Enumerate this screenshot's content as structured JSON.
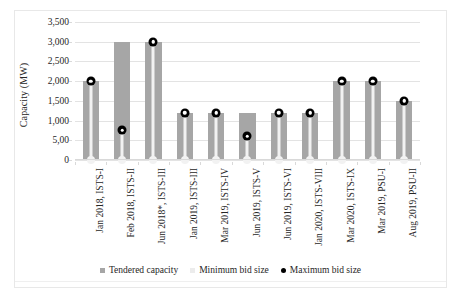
{
  "chart_data": {
    "type": "bar",
    "title": "",
    "xlabel": "",
    "ylabel": "Capacity (MW)",
    "ylim": [
      0,
      3500
    ],
    "ytick_labels": [
      "3,500",
      "3,000",
      "2,500",
      "2,000",
      "1,500",
      "1,000",
      "5,00",
      "0"
    ],
    "ytick_values": [
      3500,
      3000,
      2500,
      2000,
      1500,
      1000,
      500,
      0
    ],
    "grid": true,
    "legend_position": "bottom",
    "categories": [
      "Jan 2018, ISTS-I",
      "Feb 2018, ISTS-II",
      "Jun 2018*, ISTS-III",
      "Jan 2019, ISTS-III",
      "Mar 2019, ISTS-IV",
      "Jun 2019, ISTS-V",
      "Jun 2019, ISTS-VI",
      "Jan 2020, ISTS-VIII",
      "Mar 2020, ISTS-IX",
      "Mar 2019, PSU-I",
      "Aug 2019, PSU-II"
    ],
    "series": [
      {
        "name": "Tendered capacity",
        "type": "bar",
        "color": "#a6a6a6",
        "values": [
          2000,
          3000,
          3000,
          1200,
          1200,
          1200,
          1200,
          1200,
          2000,
          2000,
          1500
        ]
      },
      {
        "name": "Minimum bid size",
        "type": "marker",
        "color": "#f2f2f2",
        "values": [
          0,
          0,
          0,
          0,
          0,
          0,
          0,
          0,
          0,
          0,
          0
        ]
      },
      {
        "name": "Maximum bid size",
        "type": "marker",
        "color": "#000000",
        "values": [
          2000,
          750,
          3000,
          1200,
          1200,
          600,
          1200,
          1200,
          2000,
          2000,
          1500
        ]
      }
    ]
  },
  "legend": {
    "items": [
      {
        "label": "Tendered capacity",
        "marker": "square",
        "color": "#a6a6a6"
      },
      {
        "label": "Minimum bid size",
        "marker": "square",
        "color": "#ececec"
      },
      {
        "label": "Maximum bid size",
        "marker": "dot",
        "color": "#000000"
      }
    ]
  }
}
